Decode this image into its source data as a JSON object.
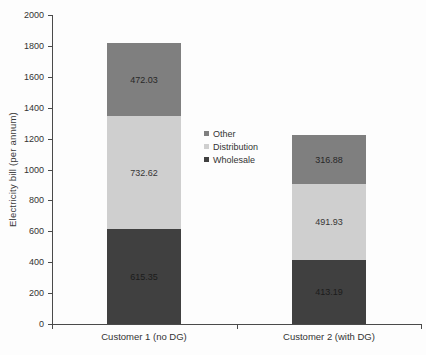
{
  "chart_data": {
    "type": "bar",
    "stacked": true,
    "title": "",
    "xlabel": "",
    "ylabel": "Electricity bill (per annum)",
    "ylim": [
      0,
      2000
    ],
    "ytick_step": 200,
    "yticks": [
      0,
      200,
      400,
      600,
      800,
      1000,
      1200,
      1400,
      1600,
      1800,
      2000
    ],
    "grid": false,
    "data_labels": true,
    "categories": [
      "Customer 1 (no DG)",
      "Customer 2 (with DG)"
    ],
    "series": [
      {
        "name": "Wholesale",
        "color": "#404040",
        "values": [
          615.35,
          413.19
        ]
      },
      {
        "name": "Distribution",
        "color": "#cfcfcf",
        "values": [
          732.62,
          491.93
        ]
      },
      {
        "name": "Other",
        "color": "#7f7f7f",
        "values": [
          472.03,
          316.88
        ]
      }
    ],
    "stack_totals": [
      1820.0,
      1222.0
    ],
    "legend": {
      "position": "center-left-of-plot",
      "entries": [
        {
          "label": "Other",
          "color": "#7f7f7f"
        },
        {
          "label": "Distribution",
          "color": "#cfcfcf"
        },
        {
          "label": "Wholesale",
          "color": "#404040"
        }
      ]
    },
    "axis_color": "#4a4a4a"
  }
}
